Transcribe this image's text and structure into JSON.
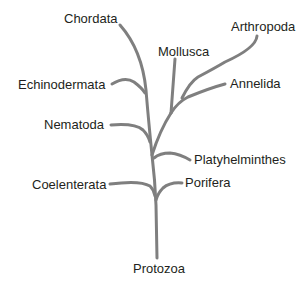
{
  "diagram": {
    "type": "phylogenetic-tree",
    "root": "Protozoa",
    "line_color": "#7f7f7f",
    "text_color": "#231f20",
    "labels": {
      "chordata": "Chordata",
      "arthropoda": "Arthropoda",
      "mollusca": "Mollusca",
      "annelida": "Annelida",
      "echinodermata": "Echinodermata",
      "nematoda": "Nematoda",
      "platyhelminthes": "Platyhelminthes",
      "coelenterata": "Coelenterata",
      "porifera": "Porifera",
      "protozoa": "Protozoa"
    }
  }
}
